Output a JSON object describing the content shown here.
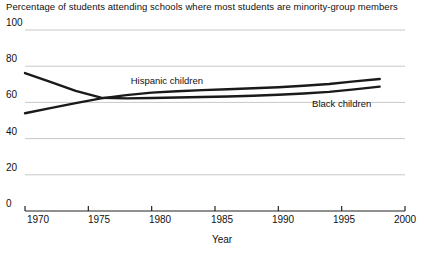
{
  "chart_data": {
    "type": "line",
    "title": "Percentage of students attending schools where most students are minority-group members",
    "xlabel": "Year",
    "ylabel": "",
    "xlim": [
      1970,
      2000
    ],
    "ylim": [
      0,
      100
    ],
    "xticks": [
      1970,
      1975,
      1980,
      1985,
      1990,
      1995,
      2000
    ],
    "yticks": [
      0,
      20,
      40,
      60,
      80,
      100
    ],
    "grid": true,
    "legend_position": "inline-labels",
    "x": [
      1970,
      1972,
      1974,
      1976,
      1978,
      1980,
      1982,
      1984,
      1986,
      1988,
      1990,
      1992,
      1994,
      1996,
      1998
    ],
    "series": [
      {
        "name": "Hispanic children",
        "label": "Hispanic children",
        "color": "#1a1a1a",
        "values": [
          54.0,
          56.8,
          59.6,
          62.2,
          64.0,
          65.4,
          66.2,
          66.8,
          67.3,
          67.8,
          68.4,
          69.2,
          70.2,
          71.6,
          72.9
        ]
      },
      {
        "name": "Black children",
        "label": "Black children",
        "color": "#1a1a1a",
        "values": [
          76.2,
          71.4,
          66.4,
          62.6,
          62.2,
          62.4,
          62.7,
          63.0,
          63.3,
          63.7,
          64.2,
          64.9,
          65.8,
          67.2,
          68.7
        ]
      }
    ],
    "annotations": [
      {
        "text": "Hispanic children",
        "x": 1981.2,
        "y": 71.5
      },
      {
        "text": "Black children",
        "x": 1995.0,
        "y": 58.5
      }
    ]
  },
  "axis": {
    "y_tick_labels": [
      "100",
      "80",
      "60",
      "40",
      "20",
      "0"
    ],
    "x_tick_labels": [
      "1970",
      "1975",
      "1980",
      "1985",
      "1990",
      "1995",
      "2000"
    ],
    "x_title": "Year"
  },
  "style": {
    "line_color": "#1a1a1a",
    "grid_color": "#c9c9c9",
    "axis_color": "#222222",
    "background": "#ffffff",
    "text_color": "#111111"
  }
}
